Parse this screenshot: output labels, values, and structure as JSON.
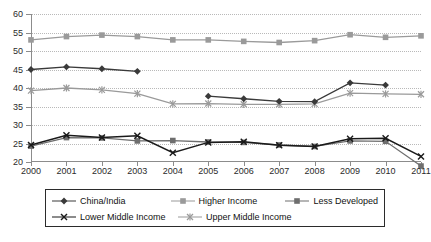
{
  "chart_data": {
    "type": "line",
    "title": "",
    "xlabel": "",
    "ylabel": "",
    "x": [
      2000,
      2001,
      2002,
      2003,
      2004,
      2005,
      2006,
      2007,
      2008,
      2009,
      2010,
      2011
    ],
    "xticklabels": [
      "2000",
      "2001",
      "2002",
      "2003",
      "2004",
      "2005",
      "2006",
      "2007",
      "2008",
      "2009",
      "2010",
      "2011"
    ],
    "yticklabels": [
      "20",
      "25",
      "30",
      "35",
      "40",
      "45",
      "50",
      "55",
      "60"
    ],
    "yticks": [
      20,
      25,
      30,
      35,
      40,
      45,
      50,
      55,
      60
    ],
    "ylim": [
      20,
      60
    ],
    "grid": "horizontal-dotted",
    "legend_position": "bottom",
    "series": [
      {
        "name": "China/India",
        "color": "#3a3a3a",
        "marker": "diamond",
        "x": [
          2000,
          2001,
          2002,
          2003
        ],
        "values": [
          45.0,
          45.7,
          45.2,
          44.5
        ]
      },
      {
        "name": "Higher Income",
        "color": "#9a9a9a",
        "marker": "square",
        "x": [
          2000,
          2001,
          2002,
          2003,
          2004,
          2005,
          2006,
          2007,
          2008,
          2009,
          2010,
          2011
        ],
        "values": [
          53.0,
          53.9,
          54.3,
          53.9,
          53.0,
          53.0,
          52.6,
          52.3,
          52.8,
          54.4,
          53.7,
          54.1
        ]
      },
      {
        "name": "Less Developed",
        "color": "#6e6e6e",
        "marker": "square",
        "x": [
          2000,
          2001,
          2002,
          2003,
          2004,
          2005,
          2006,
          2007,
          2008,
          2009,
          2010,
          2011
        ],
        "values": [
          24.3,
          26.6,
          26.5,
          25.7,
          25.8,
          25.4,
          25.3,
          24.6,
          24.2,
          25.7,
          25.6,
          18.9
        ]
      },
      {
        "name": "Lower Middle Income",
        "color": "#1a1a1a",
        "marker": "cross",
        "x": [
          2000,
          2001,
          2002,
          2003,
          2004,
          2005,
          2006,
          2007,
          2008,
          2009,
          2010,
          2011
        ],
        "values": [
          24.6,
          27.2,
          26.6,
          27.1,
          22.5,
          25.3,
          25.5,
          24.5,
          24.2,
          26.3,
          26.4,
          21.5
        ]
      },
      {
        "name": "Upper Middle Income",
        "color": "#9a9a9a",
        "marker": "asterisk",
        "x": [
          2000,
          2001,
          2002,
          2003,
          2004,
          2005,
          2006,
          2007,
          2008,
          2009,
          2010,
          2011
        ],
        "values": [
          39.3,
          40.0,
          39.5,
          38.5,
          35.7,
          35.8,
          35.6,
          35.6,
          35.7,
          38.6,
          38.4,
          38.3
        ]
      },
      {
        "name": "Less Developed Upper Segment",
        "color": "#3a3a3a",
        "marker": "diamond",
        "x": [
          2005,
          2006,
          2007,
          2008,
          2009,
          2010
        ],
        "values": [
          37.8,
          37.1,
          36.4,
          36.3,
          41.4,
          40.8
        ]
      }
    ]
  },
  "legend": {
    "rows": [
      [
        {
          "label": "China/India",
          "color": "#3a3a3a",
          "marker": "diamond"
        },
        {
          "label": "Higher Income",
          "color": "#9a9a9a",
          "marker": "square"
        },
        {
          "label": "Less Developed",
          "color": "#6e6e6e",
          "marker": "square"
        }
      ],
      [
        {
          "label": "Lower Middle Income",
          "color": "#1a1a1a",
          "marker": "cross"
        },
        {
          "label": "Upper Middle Income",
          "color": "#9a9a9a",
          "marker": "asterisk"
        }
      ]
    ]
  }
}
